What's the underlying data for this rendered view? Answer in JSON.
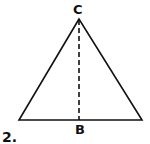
{
  "figure": {
    "number_label": "2.",
    "vertices": {
      "apex": {
        "label": "C",
        "x": 79,
        "y": 19
      },
      "bottom_left": {
        "label": "",
        "x": 19,
        "y": 120
      },
      "bottom_right": {
        "label": "",
        "x": 142,
        "y": 120
      }
    },
    "altitude": {
      "from": "C",
      "to": "B",
      "style": "dashed",
      "foot": {
        "label": "B",
        "x": 79,
        "y": 120
      }
    },
    "colors": {
      "stroke": "#111111",
      "background": "#ffffff"
    }
  }
}
